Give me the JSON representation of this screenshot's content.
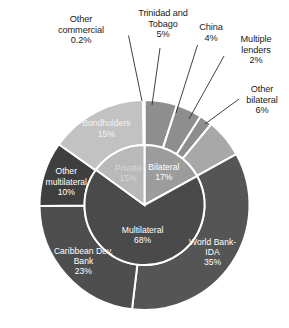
{
  "title_partial": "",
  "chart_data": {
    "type": "pie",
    "title": "",
    "subtitle": "",
    "xlabel": "",
    "ylabel": "",
    "legend_position": "none",
    "grid": false,
    "structure": "two-ring sunburst / nested donut",
    "units": "percent of total public debt",
    "inner_ring": {
      "name": "Creditor category",
      "start_angle_deg": 0,
      "direction": "clockwise",
      "categories": [
        "Bilateral",
        "Multilateral",
        "Private"
      ],
      "values": [
        17,
        68,
        15
      ],
      "labels": [
        "Bilateral\n17%",
        "Multilateral\n68%",
        "Private\n15%"
      ],
      "colors": [
        "#9c9c9c",
        "#4a4a4a",
        "#b9b9b9"
      ]
    },
    "outer_ring": {
      "name": "Individual creditor",
      "start_angle_deg": 0,
      "direction": "clockwise",
      "categories": [
        "Trinidad and Tobago",
        "China",
        "Multiple lenders",
        "Other bilateral",
        "World Bank-IDA",
        "Caribbean Dev. Bank",
        "Other multilateral",
        "Bondholders",
        "Other commercial"
      ],
      "values": [
        5,
        4,
        2,
        6,
        35,
        23,
        10,
        15,
        0.2
      ],
      "value_labels": [
        "5%",
        "4%",
        "2%",
        "6%",
        "35%",
        "23%",
        "10%",
        "15%",
        "0.2%"
      ],
      "parents": [
        "Bilateral",
        "Bilateral",
        "Bilateral",
        "Bilateral",
        "Multilateral",
        "Multilateral",
        "Multilateral",
        "Private",
        "Private"
      ],
      "colors": [
        "#8e8e8e",
        "#8e8e8e",
        "#8e8e8e",
        "#a8a8a8",
        "#555555",
        "#4e4e4e",
        "#3f3f3f",
        "#c2c2c2",
        "#d5d5d5"
      ]
    }
  },
  "inner_slice_labels": [
    {
      "name": "Bilateral",
      "pct": "17%",
      "line1": "Bilateral",
      "line2": "17%"
    },
    {
      "name": "Multilateral",
      "pct": "68%",
      "line1": "Multilateral",
      "line2": "68%"
    },
    {
      "name": "Private",
      "pct": "15%",
      "line1": "Private",
      "line2": "15%"
    }
  ],
  "outer_inside_labels": [
    {
      "name": "World Bank-IDA",
      "line1": "World Bank-",
      "line2": "IDA",
      "line3": "35%"
    },
    {
      "name": "Caribbean Dev. Bank",
      "line1": "Caribbean Dev.",
      "line2": "Bank",
      "line3": "23%"
    },
    {
      "name": "Other multilateral",
      "line1": "Other",
      "line2": "multilateral",
      "line3": "10%"
    },
    {
      "name": "Bondholders",
      "line1": "Bondholders",
      "line2": "15%",
      "line3": ""
    }
  ],
  "callouts": [
    {
      "name": "other-commercial",
      "text": "Other\ncommercial\n0.2%"
    },
    {
      "name": "trinidad-and-tobago",
      "text": "Trinidad and\nTobago\n5%"
    },
    {
      "name": "china",
      "text": "China\n4%"
    },
    {
      "name": "multiple-lenders",
      "text": "Multiple\nlenders\n2%"
    },
    {
      "name": "other-bilateral",
      "text": "Other\nbilateral\n6%"
    }
  ],
  "colors": {
    "background": "#ffffff",
    "dark_gray": "#4a4a4a",
    "mid_gray": "#8e8e8e",
    "light_gray": "#c2c2c2",
    "very_light_gray": "#d5d5d5",
    "separator": "#ffffff",
    "text": "#1a1a1a",
    "label_on_fill": "#ffffff"
  }
}
